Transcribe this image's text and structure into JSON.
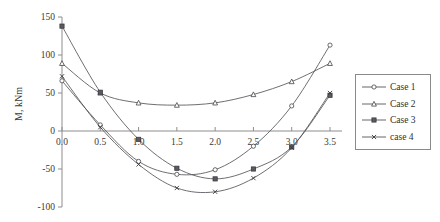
{
  "chart_data": {
    "type": "line",
    "title": "",
    "subtitle": "",
    "xlabel": "",
    "ylabel": "M, kNm",
    "xlim": [
      0.0,
      3.5
    ],
    "ylim": [
      -100,
      150
    ],
    "x_ticks": [
      "0.0",
      "0.5",
      "1.0",
      "1.5",
      "2.0",
      "2.5",
      "3.0",
      "3.5"
    ],
    "x_tick_values": [
      0.0,
      0.5,
      1.0,
      1.5,
      2.0,
      2.5,
      3.0,
      3.5
    ],
    "y_ticks": [
      "150",
      "100",
      "50",
      "0",
      "-50",
      "-100"
    ],
    "y_tick_values": [
      150,
      100,
      50,
      0,
      -50,
      -100
    ],
    "grid": false,
    "zero_line": true,
    "legend_position": "right",
    "x": [
      0.0,
      0.5,
      1.0,
      1.5,
      2.0,
      2.5,
      3.0,
      3.5
    ],
    "series": [
      {
        "name": "Case 1",
        "marker": "circle",
        "values": [
          66,
          8,
          -40,
          -57,
          -51,
          -20,
          33,
          113
        ]
      },
      {
        "name": "Case 2",
        "marker": "triangle",
        "values": [
          89,
          50,
          37,
          34,
          37,
          48,
          65,
          89
        ]
      },
      {
        "name": "Case 3",
        "marker": "square",
        "values": [
          138,
          51,
          -11,
          -49,
          -63,
          -50,
          -21,
          47
        ]
      },
      {
        "name": "case 4",
        "marker": "cross",
        "values": [
          72,
          5,
          -44,
          -75,
          -80,
          -62,
          -22,
          50
        ]
      }
    ],
    "colors": {
      "series_stroke": "#55555a",
      "axis": "#8d8d8d",
      "text": "#3a3a3a",
      "legend_border": "#8a8a8a",
      "background": "#ffffff"
    }
  },
  "legend": {
    "items": [
      {
        "label": "Case 1",
        "marker": "circle"
      },
      {
        "label": "Case 2",
        "marker": "triangle"
      },
      {
        "label": "Case 3",
        "marker": "square"
      },
      {
        "label": "case 4",
        "marker": "cross"
      }
    ]
  }
}
